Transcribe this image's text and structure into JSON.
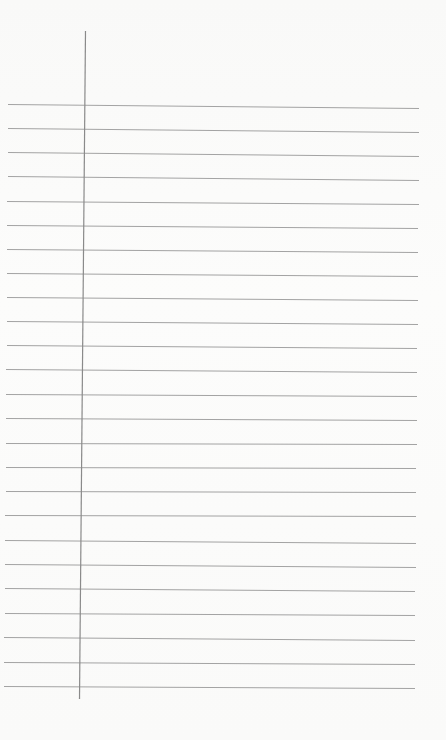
{
  "page": {
    "type": "ruled-notepad-sheet",
    "width": 446,
    "height": 740,
    "background_color": "#fbfbfa"
  },
  "margin_line": {
    "color": "#8a8a8a",
    "width": 1.2,
    "x1": 85,
    "y1": 31,
    "x2": 79,
    "y2": 699
  },
  "ruled_lines": {
    "color": "#a3a3a3",
    "width": 1,
    "count": 25,
    "lines": [
      {
        "x1": 8,
        "y1": 104,
        "x2": 419,
        "y2": 108
      },
      {
        "x1": 8,
        "y1": 128,
        "x2": 419,
        "y2": 132
      },
      {
        "x1": 8,
        "y1": 152,
        "x2": 419,
        "y2": 156
      },
      {
        "x1": 8,
        "y1": 176,
        "x2": 419,
        "y2": 180
      },
      {
        "x1": 7,
        "y1": 201,
        "x2": 419,
        "y2": 204
      },
      {
        "x1": 7,
        "y1": 225,
        "x2": 418,
        "y2": 228
      },
      {
        "x1": 7,
        "y1": 249,
        "x2": 418,
        "y2": 252
      },
      {
        "x1": 7,
        "y1": 273,
        "x2": 418,
        "y2": 276
      },
      {
        "x1": 7,
        "y1": 297,
        "x2": 418,
        "y2": 300
      },
      {
        "x1": 7,
        "y1": 321,
        "x2": 418,
        "y2": 324
      },
      {
        "x1": 7,
        "y1": 345,
        "x2": 417,
        "y2": 348
      },
      {
        "x1": 6,
        "y1": 369,
        "x2": 417,
        "y2": 372
      },
      {
        "x1": 6,
        "y1": 394,
        "x2": 417,
        "y2": 396
      },
      {
        "x1": 6,
        "y1": 418,
        "x2": 417,
        "y2": 420
      },
      {
        "x1": 6,
        "y1": 443,
        "x2": 417,
        "y2": 444
      },
      {
        "x1": 6,
        "y1": 467,
        "x2": 416,
        "y2": 468
      },
      {
        "x1": 6,
        "y1": 491,
        "x2": 416,
        "y2": 492
      },
      {
        "x1": 5,
        "y1": 515,
        "x2": 416,
        "y2": 516
      },
      {
        "x1": 5,
        "y1": 540,
        "x2": 416,
        "y2": 543
      },
      {
        "x1": 5,
        "y1": 564,
        "x2": 416,
        "y2": 567
      },
      {
        "x1": 5,
        "y1": 588,
        "x2": 415,
        "y2": 591
      },
      {
        "x1": 5,
        "y1": 613,
        "x2": 415,
        "y2": 615
      },
      {
        "x1": 4,
        "y1": 637,
        "x2": 415,
        "y2": 640
      },
      {
        "x1": 4,
        "y1": 662,
        "x2": 415,
        "y2": 664
      },
      {
        "x1": 4,
        "y1": 686,
        "x2": 415,
        "y2": 688
      }
    ]
  }
}
